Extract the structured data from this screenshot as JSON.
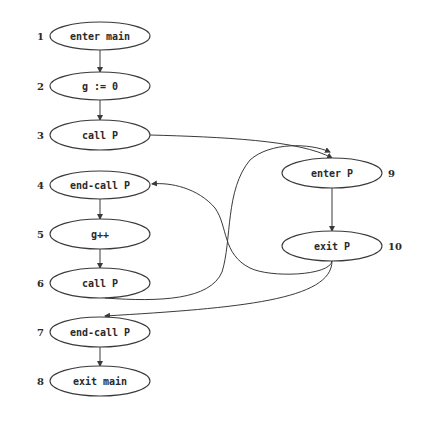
{
  "diagram": {
    "type": "interprocedural control flow graph",
    "nodes": [
      {
        "id": 1,
        "label": "enter main",
        "cx": 100,
        "cy": 36,
        "rx": 50,
        "ry": 14,
        "num_x": 37,
        "num_anchor": "start"
      },
      {
        "id": 2,
        "label": "g := 0",
        "cx": 100,
        "cy": 86,
        "rx": 50,
        "ry": 14,
        "num_x": 37,
        "num_anchor": "start"
      },
      {
        "id": 3,
        "label": "call P",
        "cx": 100,
        "cy": 135,
        "rx": 50,
        "ry": 15,
        "num_x": 37,
        "num_anchor": "start"
      },
      {
        "id": 4,
        "label": "end-call P",
        "cx": 100,
        "cy": 185,
        "rx": 50,
        "ry": 14,
        "num_x": 37,
        "num_anchor": "start"
      },
      {
        "id": 5,
        "label": "g++",
        "cx": 100,
        "cy": 234,
        "rx": 50,
        "ry": 15,
        "num_x": 37,
        "num_anchor": "start"
      },
      {
        "id": 6,
        "label": "call P",
        "cx": 100,
        "cy": 283,
        "rx": 50,
        "ry": 15,
        "num_x": 37,
        "num_anchor": "start"
      },
      {
        "id": 7,
        "label": "end-call P",
        "cx": 100,
        "cy": 332,
        "rx": 50,
        "ry": 15,
        "num_x": 37,
        "num_anchor": "start"
      },
      {
        "id": 8,
        "label": "exit main",
        "cx": 100,
        "cy": 381,
        "rx": 50,
        "ry": 15,
        "num_x": 37,
        "num_anchor": "start"
      },
      {
        "id": 9,
        "label": "enter P",
        "cx": 332,
        "cy": 173,
        "rx": 50,
        "ry": 15,
        "num_x": 388,
        "num_anchor": "start"
      },
      {
        "id": 10,
        "label": "exit P",
        "cx": 332,
        "cy": 246,
        "rx": 50,
        "ry": 15,
        "num_x": 388,
        "num_anchor": "start"
      }
    ],
    "edges": [
      {
        "from": 1,
        "to": 2,
        "d": "M100,50 L100,72",
        "arrow": [
          100,
          72
        ]
      },
      {
        "from": 2,
        "to": 3,
        "d": "M100,100 L100,120",
        "arrow": [
          100,
          120
        ]
      },
      {
        "from": 4,
        "to": 5,
        "d": "M100,199 L100,219",
        "arrow": [
          100,
          219
        ]
      },
      {
        "from": 5,
        "to": 6,
        "d": "M100,249 L100,268",
        "arrow": [
          100,
          268
        ]
      },
      {
        "from": 7,
        "to": 8,
        "d": "M100,347 L100,366",
        "arrow": [
          100,
          366
        ]
      },
      {
        "from": 9,
        "to": 10,
        "d": "M332,188 L332,231",
        "arrow": [
          332,
          231
        ]
      },
      {
        "from": 3,
        "to": 9,
        "d": "M150,135 C220,137 300,140 332,158",
        "arrow": [
          332,
          158
        ]
      },
      {
        "from": 6,
        "to": 9,
        "d": "M105,298 C160,302 210,300 222,272 C232,240 225,190 250,160 C270,142 310,143 330,152"
      },
      {
        "from": 10,
        "to": 4,
        "d": "M332,261 C330,276 270,278 250,268 C222,254 228,226 215,208 C198,188 170,182 152,184",
        "arrow": [
          152,
          184
        ]
      },
      {
        "from": 10,
        "to": 7,
        "d": "M332,261 C332,300 240,308 105,316",
        "arrow": [
          105,
          316
        ]
      }
    ]
  }
}
